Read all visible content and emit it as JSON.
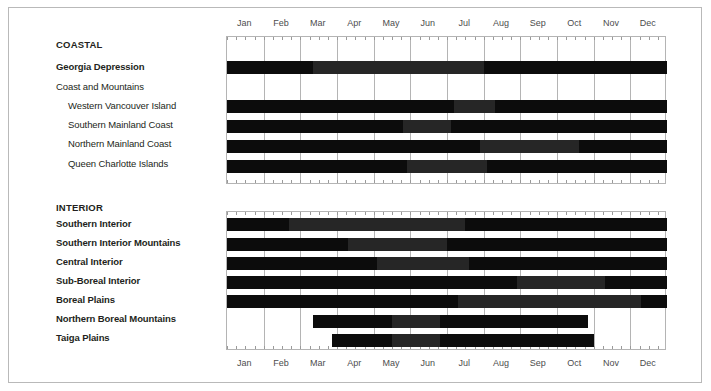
{
  "chart_data": {
    "type": "bar",
    "title": "",
    "subtitle": "",
    "xlabel": "",
    "ylabel": "",
    "grid": true,
    "legend_position": "none",
    "x_axis": {
      "tick_labels": [
        "Jan",
        "Feb",
        "Mar",
        "Apr",
        "May",
        "Jun",
        "Jul",
        "Aug",
        "Sep",
        "Oct",
        "Nov",
        "Dec"
      ],
      "range_start_month": 1,
      "range_end_month": 12,
      "minor_ticks_per_month": 4,
      "top_axis_shown": true,
      "bottom_axis_shown": true
    },
    "colors": {
      "dark": "#0c0c0c",
      "mid": "#262626",
      "frame": "#b9b9b9",
      "grid": "#b4b4b4",
      "label": "#231f20",
      "axis_label": "#4d4d4d",
      "background": "#ffffff"
    },
    "groups": [
      {
        "name": "COASTAL",
        "rows": [
          {
            "label": "Georgia Depression",
            "indent": 0,
            "bold": true,
            "segments": [
              {
                "start_month": 1.0,
                "end_month": 3.35,
                "shade": "dark"
              },
              {
                "start_month": 3.35,
                "end_month": 8.0,
                "shade": "mid"
              },
              {
                "start_month": 8.0,
                "end_month": 13.0,
                "shade": "dark"
              }
            ]
          },
          {
            "label": "Coast and Mountains",
            "indent": 0,
            "bold": false,
            "segments": []
          },
          {
            "label": "Western Vancouver Island",
            "indent": 1,
            "bold": false,
            "segments": [
              {
                "start_month": 1.0,
                "end_month": 7.2,
                "shade": "dark"
              },
              {
                "start_month": 7.2,
                "end_month": 8.3,
                "shade": "mid"
              },
              {
                "start_month": 8.3,
                "end_month": 13.0,
                "shade": "dark"
              }
            ]
          },
          {
            "label": "Southern Mainland Coast",
            "indent": 1,
            "bold": false,
            "segments": [
              {
                "start_month": 1.0,
                "end_month": 5.8,
                "shade": "dark"
              },
              {
                "start_month": 5.8,
                "end_month": 7.1,
                "shade": "mid"
              },
              {
                "start_month": 7.1,
                "end_month": 13.0,
                "shade": "dark"
              }
            ]
          },
          {
            "label": "Northern Mainland Coast",
            "indent": 1,
            "bold": false,
            "segments": [
              {
                "start_month": 1.0,
                "end_month": 7.9,
                "shade": "dark"
              },
              {
                "start_month": 7.9,
                "end_month": 10.6,
                "shade": "mid"
              },
              {
                "start_month": 10.6,
                "end_month": 13.0,
                "shade": "dark"
              }
            ]
          },
          {
            "label": "Queen Charlotte Islands",
            "indent": 1,
            "bold": false,
            "segments": [
              {
                "start_month": 1.0,
                "end_month": 5.9,
                "shade": "dark"
              },
              {
                "start_month": 5.9,
                "end_month": 8.1,
                "shade": "mid"
              },
              {
                "start_month": 8.1,
                "end_month": 13.0,
                "shade": "dark"
              }
            ]
          }
        ]
      },
      {
        "name": "INTERIOR",
        "rows": [
          {
            "label": "Southern Interior",
            "indent": 0,
            "bold": true,
            "segments": [
              {
                "start_month": 1.0,
                "end_month": 2.7,
                "shade": "dark"
              },
              {
                "start_month": 2.7,
                "end_month": 7.5,
                "shade": "mid"
              },
              {
                "start_month": 7.5,
                "end_month": 13.0,
                "shade": "dark"
              }
            ]
          },
          {
            "label": "Southern Interior Mountains",
            "indent": 0,
            "bold": true,
            "segments": [
              {
                "start_month": 1.0,
                "end_month": 4.3,
                "shade": "dark"
              },
              {
                "start_month": 4.3,
                "end_month": 7.0,
                "shade": "mid"
              },
              {
                "start_month": 7.0,
                "end_month": 13.0,
                "shade": "dark"
              }
            ]
          },
          {
            "label": "Central Interior",
            "indent": 0,
            "bold": true,
            "segments": [
              {
                "start_month": 1.0,
                "end_month": 5.1,
                "shade": "dark"
              },
              {
                "start_month": 5.1,
                "end_month": 7.6,
                "shade": "mid"
              },
              {
                "start_month": 7.6,
                "end_month": 13.0,
                "shade": "dark"
              }
            ]
          },
          {
            "label": "Sub-Boreal Interior",
            "indent": 0,
            "bold": true,
            "segments": [
              {
                "start_month": 1.0,
                "end_month": 8.9,
                "shade": "dark"
              },
              {
                "start_month": 8.9,
                "end_month": 11.3,
                "shade": "mid"
              },
              {
                "start_month": 11.3,
                "end_month": 13.0,
                "shade": "dark"
              }
            ]
          },
          {
            "label": "Boreal Plains",
            "indent": 0,
            "bold": true,
            "segments": [
              {
                "start_month": 1.0,
                "end_month": 7.3,
                "shade": "dark"
              },
              {
                "start_month": 7.3,
                "end_month": 12.3,
                "shade": "mid"
              },
              {
                "start_month": 12.3,
                "end_month": 13.0,
                "shade": "dark"
              }
            ]
          },
          {
            "label": "Northern Boreal Mountains",
            "indent": 0,
            "bold": true,
            "segments": [
              {
                "start_month": 3.35,
                "end_month": 5.5,
                "shade": "dark"
              },
              {
                "start_month": 5.5,
                "end_month": 6.8,
                "shade": "mid"
              },
              {
                "start_month": 6.8,
                "end_month": 10.85,
                "shade": "dark"
              }
            ]
          },
          {
            "label": "Taiga Plains",
            "indent": 0,
            "bold": true,
            "segments": [
              {
                "start_month": 3.85,
                "end_month": 5.5,
                "shade": "dark"
              },
              {
                "start_month": 5.5,
                "end_month": 6.8,
                "shade": "mid"
              },
              {
                "start_month": 6.8,
                "end_month": 11.0,
                "shade": "dark"
              }
            ]
          }
        ]
      }
    ]
  }
}
